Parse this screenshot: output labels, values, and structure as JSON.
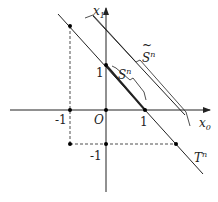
{
  "diagram": {
    "axes": {
      "x_label": "x",
      "x_sub": "0",
      "y_label": "x",
      "y_sub": "1",
      "origin_label": "O"
    },
    "ticks": {
      "x_neg": "-1",
      "x_pos": "1",
      "y_pos": "1",
      "y_neg": "-1"
    },
    "lines": {
      "T": {
        "label": "T",
        "sup": "n"
      },
      "S": {
        "label": "S",
        "sup": "n"
      },
      "S_tilde": {
        "label": "S",
        "sup": "n",
        "accent": "~"
      }
    },
    "points": [
      {
        "x": -1,
        "y": 2
      },
      {
        "x": 0,
        "y": 1
      },
      {
        "x": 1,
        "y": 0
      },
      {
        "x": -1,
        "y": 0
      },
      {
        "x": 0,
        "y": 0
      },
      {
        "x": -1,
        "y": -1
      },
      {
        "x": 0,
        "y": -1
      },
      {
        "x": 2,
        "y": -1
      }
    ],
    "colors": {
      "ink": "#222222",
      "background": "#ffffff"
    }
  }
}
